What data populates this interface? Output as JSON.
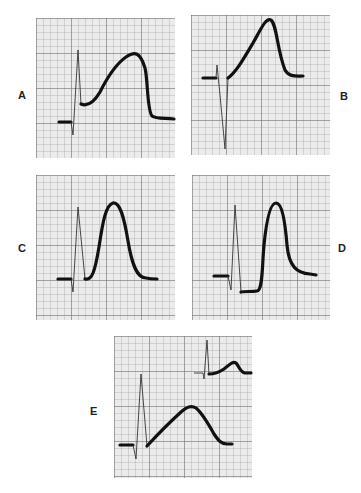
{
  "figure": {
    "panels": [
      {
        "id": "A",
        "label": "A",
        "description": "QRS followed by elevated, broad plateau-shaped monophasic wave"
      },
      {
        "id": "B",
        "label": "B",
        "description": "deep QS complex followed by steeply rising elevated ST segment merging into tall peaked wave"
      },
      {
        "id": "C",
        "label": "C",
        "description": "small rS complex followed by tall symmetric peaked T wave"
      },
      {
        "id": "D",
        "label": "D",
        "description": "QRS with depressed ST segment followed by tall narrow peaked T wave"
      },
      {
        "id": "E",
        "label": "E",
        "description": "QRS with gradually rising broad triangular wave; inset shows small low-amplitude comparison complex"
      }
    ],
    "grid": {
      "paper_color": "#ebebeb",
      "major_line_color": "#8a8a8a",
      "minor_line_color": "#b4b4b4"
    },
    "trace_color": "#111111"
  }
}
